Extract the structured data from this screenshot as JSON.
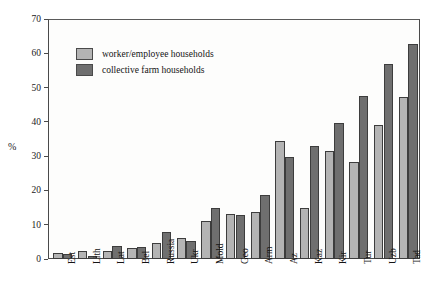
{
  "chart_data": {
    "type": "bar",
    "title": "",
    "subtitle": "",
    "xlabel": "",
    "ylabel": "%",
    "ylim": [
      0,
      70
    ],
    "yticks": [
      0,
      10,
      20,
      30,
      40,
      50,
      60,
      70
    ],
    "grid": false,
    "legend_position": "inside-top-left",
    "categories": [
      "Est",
      "Lith",
      "Lat",
      "Bel",
      "Russia",
      "Ukr",
      "Mold",
      "Geo",
      "Arm",
      "Az",
      "Kaz",
      "Kir",
      "Tur",
      "Uzb",
      "Tad"
    ],
    "series": [
      {
        "name": "worker/employee households",
        "color": "#b4b4b4",
        "values": [
          1.8,
          2.4,
          2.2,
          3.2,
          4.8,
          6.2,
          11.2,
          13.2,
          13.7,
          34.5,
          14.8,
          31.6,
          28.4,
          39.0,
          47.2
        ]
      },
      {
        "name": "collective farm households",
        "color": "#6f6f6f",
        "values": [
          1.4,
          1.0,
          3.7,
          3.5,
          7.8,
          5.3,
          14.8,
          12.9,
          18.6,
          29.7,
          33.0,
          39.8,
          47.6,
          56.8,
          62.7
        ]
      }
    ]
  },
  "axis": {
    "y_title": "%",
    "y_tick_labels": [
      "0",
      "10",
      "20",
      "30",
      "40",
      "50",
      "60",
      "70"
    ]
  },
  "legend": {
    "items": [
      {
        "label": "worker/employee households",
        "swatch": "#b4b4b4"
      },
      {
        "label": "collective farm households",
        "swatch": "#6f6f6f"
      }
    ]
  }
}
